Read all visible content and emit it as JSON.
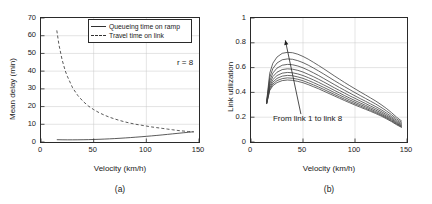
{
  "figure": {
    "panels": [
      {
        "caption": "(a)",
        "xlabel": "Velocity (km/h)",
        "ylabel": "Mean delay (min)",
        "annotation": "r = 8"
      },
      {
        "caption": "(b)",
        "xlabel": "Velocity (km/h)",
        "ylabel": "Link utilization",
        "annotation": "From link 1 to link 8"
      }
    ]
  },
  "chart_data": [
    {
      "type": "line",
      "title": "",
      "panel_label": "(a)",
      "xlabel": "Velocity (km/h)",
      "ylabel": "Mean delay (min)",
      "xlim": [
        0,
        150
      ],
      "ylim": [
        0,
        70
      ],
      "xticks": [
        0,
        50,
        100,
        150
      ],
      "yticks": [
        0,
        10,
        20,
        30,
        40,
        50,
        60,
        70
      ],
      "grid": true,
      "legend_position": "top-right",
      "annotations": [
        {
          "text": "r = 8",
          "x": 130,
          "y": 44
        }
      ],
      "series": [
        {
          "name": "Queueing time on ramp",
          "style": "solid",
          "color": "#303030",
          "x": [
            15,
            20,
            25,
            30,
            35,
            40,
            45,
            50,
            55,
            60,
            65,
            70,
            75,
            80,
            85,
            90,
            95,
            100,
            105,
            110,
            115,
            120,
            125,
            130,
            135,
            140,
            145
          ],
          "y": [
            1.3,
            1.25,
            1.22,
            1.22,
            1.24,
            1.28,
            1.34,
            1.42,
            1.52,
            1.64,
            1.78,
            1.93,
            2.1,
            2.3,
            2.5,
            2.72,
            2.95,
            3.2,
            3.45,
            3.72,
            4.0,
            4.3,
            4.6,
            4.9,
            5.2,
            5.5,
            5.8
          ]
        },
        {
          "name": "Travel time on link",
          "style": "dashed",
          "color": "#303030",
          "x": [
            15,
            17,
            20,
            23,
            25,
            30,
            35,
            40,
            45,
            50,
            55,
            60,
            65,
            70,
            75,
            80,
            85,
            90,
            95,
            100,
            105,
            110,
            115,
            120,
            125,
            130,
            135,
            140,
            145
          ],
          "y": [
            63.0,
            55.0,
            46.5,
            40.2,
            37.1,
            30.6,
            26.2,
            22.9,
            20.3,
            18.3,
            16.6,
            15.2,
            14.0,
            13.0,
            12.1,
            11.3,
            10.6,
            10.0,
            9.5,
            9.0,
            8.5,
            8.1,
            7.7,
            7.3,
            6.9,
            6.5,
            6.2,
            5.9,
            5.7
          ]
        }
      ]
    },
    {
      "type": "line",
      "title": "",
      "panel_label": "(b)",
      "xlabel": "Velocity (km/h)",
      "ylabel": "Link utilization",
      "xlim": [
        0,
        150
      ],
      "ylim": [
        0,
        1
      ],
      "xticks": [
        0,
        50,
        100,
        150
      ],
      "yticks": [
        0,
        0.2,
        0.4,
        0.6,
        0.8,
        1
      ],
      "grid": true,
      "legend_position": "none",
      "annotations": [
        {
          "text": "From link 1 to link 8",
          "x": 22,
          "y": 0.18,
          "arrow_from": [
            48,
            0.225
          ],
          "arrow_to": [
            33,
            0.82
          ]
        }
      ],
      "x": [
        15,
        18,
        21,
        25,
        30,
        35,
        40,
        45,
        50,
        55,
        60,
        65,
        70,
        75,
        80,
        85,
        90,
        95,
        100,
        105,
        110,
        115,
        120,
        125,
        130,
        135,
        140,
        145
      ],
      "series": [
        {
          "name": "link 1",
          "values": [
            0.325,
            0.555,
            0.635,
            0.685,
            0.715,
            0.723,
            0.72,
            0.708,
            0.69,
            0.668,
            0.643,
            0.617,
            0.59,
            0.562,
            0.534,
            0.507,
            0.48,
            0.454,
            0.429,
            0.404,
            0.38,
            0.355,
            0.33,
            0.302,
            0.272,
            0.238,
            0.2,
            0.168
          ]
        },
        {
          "name": "link 2",
          "values": [
            0.32,
            0.52,
            0.592,
            0.637,
            0.663,
            0.67,
            0.667,
            0.656,
            0.64,
            0.62,
            0.597,
            0.573,
            0.548,
            0.522,
            0.496,
            0.471,
            0.446,
            0.422,
            0.398,
            0.375,
            0.352,
            0.329,
            0.306,
            0.28,
            0.252,
            0.221,
            0.186,
            0.157
          ]
        },
        {
          "name": "link 3",
          "values": [
            0.316,
            0.492,
            0.556,
            0.596,
            0.619,
            0.626,
            0.623,
            0.613,
            0.598,
            0.579,
            0.558,
            0.536,
            0.512,
            0.488,
            0.464,
            0.44,
            0.417,
            0.394,
            0.372,
            0.35,
            0.329,
            0.307,
            0.285,
            0.261,
            0.235,
            0.206,
            0.174,
            0.147
          ]
        },
        {
          "name": "link 4",
          "values": [
            0.313,
            0.47,
            0.527,
            0.563,
            0.584,
            0.59,
            0.587,
            0.578,
            0.564,
            0.546,
            0.527,
            0.506,
            0.484,
            0.461,
            0.438,
            0.416,
            0.394,
            0.372,
            0.352,
            0.331,
            0.311,
            0.29,
            0.27,
            0.247,
            0.222,
            0.195,
            0.164,
            0.139
          ]
        },
        {
          "name": "link 5",
          "values": [
            0.311,
            0.452,
            0.503,
            0.536,
            0.555,
            0.561,
            0.558,
            0.549,
            0.536,
            0.519,
            0.501,
            0.481,
            0.46,
            0.439,
            0.417,
            0.396,
            0.374,
            0.354,
            0.334,
            0.315,
            0.296,
            0.276,
            0.257,
            0.235,
            0.211,
            0.186,
            0.156,
            0.132
          ]
        },
        {
          "name": "link 6",
          "values": [
            0.309,
            0.437,
            0.483,
            0.513,
            0.531,
            0.537,
            0.534,
            0.525,
            0.513,
            0.497,
            0.479,
            0.46,
            0.44,
            0.42,
            0.399,
            0.379,
            0.359,
            0.339,
            0.32,
            0.302,
            0.284,
            0.265,
            0.246,
            0.225,
            0.202,
            0.178,
            0.15,
            0.126
          ]
        },
        {
          "name": "link 7",
          "values": [
            0.307,
            0.425,
            0.467,
            0.495,
            0.511,
            0.517,
            0.514,
            0.506,
            0.494,
            0.478,
            0.461,
            0.443,
            0.424,
            0.404,
            0.384,
            0.365,
            0.345,
            0.326,
            0.308,
            0.291,
            0.273,
            0.255,
            0.237,
            0.217,
            0.195,
            0.171,
            0.144,
            0.121
          ]
        },
        {
          "name": "link 8",
          "values": [
            0.306,
            0.415,
            0.454,
            0.479,
            0.495,
            0.5,
            0.497,
            0.489,
            0.478,
            0.463,
            0.446,
            0.429,
            0.41,
            0.391,
            0.372,
            0.353,
            0.334,
            0.316,
            0.298,
            0.281,
            0.264,
            0.247,
            0.229,
            0.21,
            0.188,
            0.165,
            0.139,
            0.117
          ]
        }
      ]
    }
  ]
}
